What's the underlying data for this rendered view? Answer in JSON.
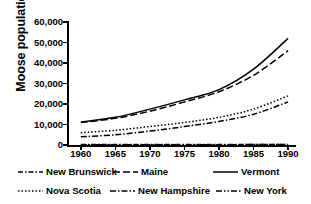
{
  "chart_data": {
    "type": "line",
    "title": "",
    "xlabel": "",
    "ylabel": "Moose population",
    "xlim": [
      1958,
      1991
    ],
    "ylim": [
      0,
      60000
    ],
    "grid": false,
    "legend_position": "bottom",
    "x_ticks": [
      "1960",
      "1965",
      "1970",
      "1975",
      "1980",
      "1985",
      "1990"
    ],
    "x_tick_values": [
      1960,
      1965,
      1970,
      1975,
      1980,
      1985,
      1990
    ],
    "y_ticks": [
      "0",
      "10,000",
      "20,000",
      "30,000",
      "40,000",
      "50,000",
      "60,000"
    ],
    "y_tick_values": [
      0,
      10000,
      20000,
      30000,
      40000,
      50000,
      60000
    ],
    "x": [
      1960,
      1965,
      1970,
      1975,
      1980,
      1985,
      1990
    ],
    "series": [
      {
        "name": "New Brunswick",
        "style": "dash-dot",
        "dasharray": "5,2,1.5,2",
        "values": [
          200,
          200,
          200,
          200,
          200,
          250,
          300
        ]
      },
      {
        "name": "Maine",
        "style": "dashed",
        "dasharray": "7,3",
        "values": [
          11000,
          13000,
          16500,
          21000,
          26000,
          34000,
          46000
        ]
      },
      {
        "name": "Vermont",
        "style": "solid",
        "dasharray": "",
        "values": [
          11200,
          13500,
          17500,
          22000,
          27000,
          37000,
          52000
        ]
      },
      {
        "name": "Nova Scotia",
        "style": "dotted",
        "dasharray": "1.5,2",
        "values": [
          6000,
          7200,
          9000,
          11000,
          13500,
          17500,
          24000
        ]
      },
      {
        "name": "New Hampshire",
        "style": "dash-dot",
        "dasharray": "6,2,1.5,2",
        "values": [
          4000,
          5000,
          6800,
          9000,
          11500,
          15000,
          21000
        ]
      },
      {
        "name": "New York",
        "style": "dash-dot-dot",
        "dasharray": "6,2,1.5,2,1.5,2",
        "values": [
          150,
          150,
          150,
          150,
          150,
          200,
          250
        ]
      }
    ]
  },
  "legend": {
    "rows": [
      [
        {
          "label": "New Brunswick",
          "sample": "dash-dot-line-sample"
        },
        {
          "label": "Maine",
          "sample": "dashed-line-sample"
        },
        {
          "label": "Vermont",
          "sample": "solid-line-sample"
        }
      ],
      [
        {
          "label": "Nova Scotia",
          "sample": "dotted-line-sample"
        },
        {
          "label": "New Hampshire",
          "sample": "dash-dot-line-sample"
        },
        {
          "label": "New York",
          "sample": "dash-dot-dot-line-sample"
        }
      ]
    ]
  },
  "colors": {
    "ink": "#000000",
    "background": "#ffffff"
  }
}
